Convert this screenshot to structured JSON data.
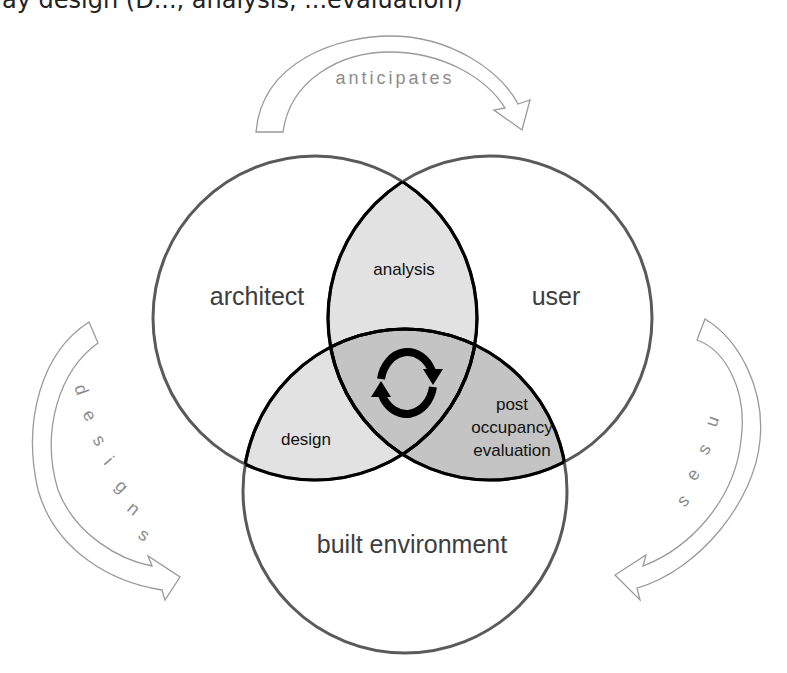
{
  "caption": {
    "text": "ay design (D..., analysis, ...evaluation)"
  },
  "diagram": {
    "type": "venn",
    "sets": [
      {
        "id": "architect",
        "label": "architect"
      },
      {
        "id": "user",
        "label": "user"
      },
      {
        "id": "built_environment",
        "label": "built environment"
      }
    ],
    "intersections": [
      {
        "sets": [
          "architect",
          "user"
        ],
        "label": "analysis"
      },
      {
        "sets": [
          "architect",
          "built_environment"
        ],
        "label": "design"
      },
      {
        "sets": [
          "user",
          "built_environment"
        ],
        "label_lines": [
          "post",
          "occupancy",
          "evaluation"
        ]
      },
      {
        "sets": [
          "architect",
          "user",
          "built_environment"
        ],
        "icon": "cycle-arrows-icon"
      }
    ],
    "relations": [
      {
        "from": "architect",
        "to": "user",
        "label": "anticipates"
      },
      {
        "from": "architect",
        "to": "built_environment",
        "label": "designs",
        "letters": [
          "d",
          "e",
          "s",
          "i",
          "g",
          "n",
          "s"
        ]
      },
      {
        "from": "user",
        "to": "built_environment",
        "label": "uses",
        "letters": [
          "u",
          "s",
          "e",
          "s"
        ]
      }
    ],
    "colors": {
      "outer_stroke": "#5a5a5a",
      "inner_stroke": "#000000",
      "pair_fill": "#e2e2e2",
      "center_fill": "#c4c4c4",
      "arrow_stroke": "#9a9a9a",
      "arrow_text": "#8c8c8c"
    }
  }
}
